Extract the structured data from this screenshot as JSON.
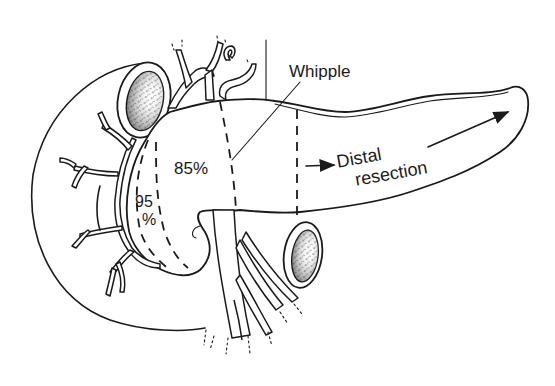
{
  "diagram": {
    "labels": {
      "whipple": "Whipple",
      "pct_85": "85%",
      "pct_95_line1": "95",
      "pct_95_line2": "%",
      "distal_line1": "Distal",
      "distal_line2": "resection"
    },
    "structures": [
      "duodenum",
      "pancreas-head",
      "pancreas-body",
      "pancreas-tail",
      "superior-mesenteric-vessels",
      "portal-vein",
      "pancreaticoduodenal-arteries",
      "celiac-branches"
    ],
    "resection_lines": [
      {
        "name": "95%",
        "style": "dashed"
      },
      {
        "name": "85%",
        "style": "dashed"
      },
      {
        "name": "Whipple",
        "style": "dashed"
      },
      {
        "name": "Distal resection",
        "style": "dashed",
        "arrow": "right"
      }
    ],
    "colors": {
      "ink": "#1a1a1a",
      "background": "#ffffff"
    }
  }
}
